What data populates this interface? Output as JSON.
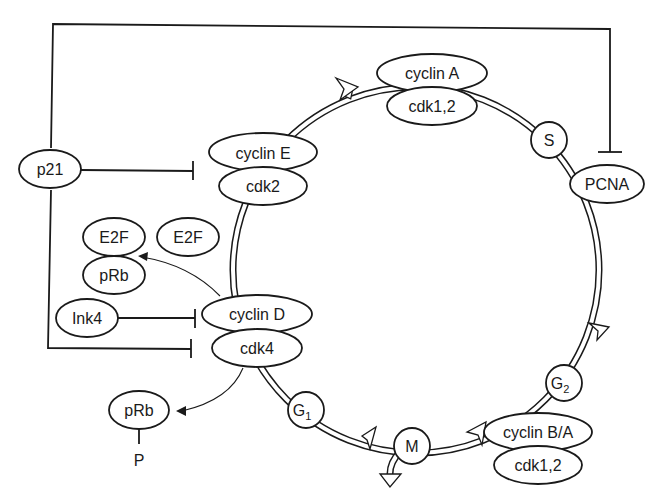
{
  "diagram": {
    "colors": {
      "stroke": "#1a1a1a",
      "background": "#ffffff"
    },
    "phases": {
      "S": {
        "label": "S"
      },
      "G2": {
        "label": "G",
        "sub": "2"
      },
      "M": {
        "label": "M"
      },
      "G1": {
        "label": "G",
        "sub": "1"
      }
    },
    "complexes": {
      "cyclinA": {
        "cyclin": "cyclin A",
        "cdk": "cdk1,2"
      },
      "cyclinE": {
        "cyclin": "cyclin E",
        "cdk": "cdk2"
      },
      "cyclinD": {
        "cyclin": "cyclin D",
        "cdk": "cdk4"
      },
      "cyclinBA": {
        "cyclin": "cyclin B/A",
        "cdk": "cdk1,2"
      }
    },
    "proteins": {
      "p21": "p21",
      "pcna": "PCNA",
      "ink4": "Ink4",
      "e2f_bound": "E2F",
      "e2f_free": "E2F",
      "prb_bound": "pRb",
      "prb_phospho": "pRb",
      "phosphate": "P"
    },
    "interactions": [
      {
        "from": "p21",
        "to": "PCNA",
        "type": "inhibition"
      },
      {
        "from": "p21",
        "to": "cyclin E/cdk2",
        "type": "inhibition"
      },
      {
        "from": "p21",
        "to": "cyclin D/cdk4",
        "type": "inhibition"
      },
      {
        "from": "Ink4",
        "to": "cyclin D/cdk4",
        "type": "inhibition"
      },
      {
        "from": "cyclin D/cdk4",
        "to": "E2F/pRb",
        "type": "activation"
      },
      {
        "from": "cyclin D/cdk4",
        "to": "pRb-P",
        "type": "phosphorylation"
      }
    ]
  }
}
